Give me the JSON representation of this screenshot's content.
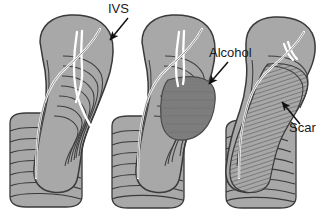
{
  "figure": {
    "background_color": "#ffffff",
    "width": 326,
    "height": 212
  },
  "palette": {
    "myocardium_fill": "#a8a8a8",
    "myocardium_light": "#b5b5b5",
    "myocardium_shadow": "#9a9a9a",
    "alcohol_fill": "#7e7e7e",
    "scar_hatch": "#6e6e6e",
    "outline": "#3a3a3a",
    "conduction_line": "#ffffff",
    "label_color": "#1a1a1a",
    "arrow_color": "#111111"
  },
  "labels": [
    {
      "id": "ivs",
      "text": "IVS",
      "x": 108,
      "y": 13,
      "panel": 1
    },
    {
      "id": "alcohol",
      "text": "Alcohol",
      "x": 209,
      "y": 57,
      "panel": 2
    },
    {
      "id": "scar",
      "text": "Scar",
      "x": 289,
      "y": 132,
      "panel": 3
    }
  ],
  "arrows": [
    {
      "id": "ivs-arrow",
      "from_x": 128,
      "from_y": 18,
      "to_x": 109,
      "to_y": 41,
      "points_to": "septum-upper-right-edge"
    },
    {
      "id": "alcohol-arrow",
      "from_x": 228,
      "from_y": 62,
      "to_x": 208,
      "to_y": 85,
      "points_to": "alcohol-infused-region"
    },
    {
      "id": "scar-arrow",
      "from_x": 300,
      "from_y": 124,
      "to_x": 281,
      "to_y": 101,
      "points_to": "scar-hatched-region"
    }
  ],
  "panels": [
    {
      "id": "panel-before",
      "index": 1,
      "caption": "Interventricular septum before ablation",
      "state": "baseline",
      "has_alcohol_region": false,
      "has_scar_region": false,
      "conduction_branches": 3
    },
    {
      "id": "panel-alcohol",
      "index": 2,
      "caption": "Alcohol infused into septal branch territory",
      "state": "alcohol-infusion",
      "has_alcohol_region": true,
      "has_scar_region": false,
      "conduction_branches": 2
    },
    {
      "id": "panel-scar",
      "index": 3,
      "caption": "Thinned septum with scar after ablation",
      "state": "post-ablation-scar",
      "has_alcohol_region": false,
      "has_scar_region": true,
      "conduction_branches": 2
    }
  ]
}
